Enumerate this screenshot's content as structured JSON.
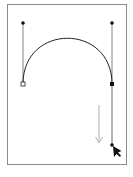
{
  "diagram": {
    "type": "bezier-pen-tool-illustration",
    "frame": {
      "x": 7,
      "y": 4,
      "width": 120,
      "height": 161,
      "stroke": "#8a8a8a",
      "fill": "#ffffff"
    },
    "curve": {
      "from": [
        23,
        84
      ],
      "c1": [
        23,
        23
      ],
      "c2": [
        112,
        23
      ],
      "to": [
        112,
        84
      ],
      "stroke": "#222222"
    },
    "anchors": [
      {
        "name": "start-anchor",
        "x": 23,
        "y": 84,
        "style": "hollow-square"
      },
      {
        "name": "end-anchor",
        "x": 112,
        "y": 84,
        "style": "filled-square"
      }
    ],
    "handles": [
      {
        "name": "left-direction-handle",
        "from": [
          23,
          84
        ],
        "to": [
          23,
          23
        ]
      },
      {
        "name": "right-direction-handle",
        "from": [
          112,
          84
        ],
        "to": [
          112,
          23
        ]
      },
      {
        "name": "dragged-direction-handle",
        "from": [
          112,
          84
        ],
        "to": [
          112,
          145
        ]
      }
    ],
    "drag_arrow": {
      "x": 99,
      "y1": 105,
      "y2": 143,
      "color": "#b0b0b0"
    },
    "cursor": {
      "x": 112,
      "y": 145,
      "icon": "pen-arrow-cursor"
    },
    "colors": {
      "line": "#222222",
      "handle": "#555555",
      "arrow": "#b0b0b0"
    }
  }
}
